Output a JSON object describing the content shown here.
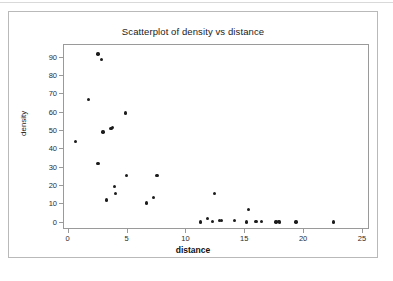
{
  "figure": {
    "title": "Scatterplot of density vs distance",
    "xlabel": "distance",
    "ylabel": "density"
  },
  "chart_data": {
    "type": "scatter",
    "title": "Scatterplot of density vs distance",
    "xlabel": "distance",
    "ylabel": "density",
    "xlim": [
      -0.4,
      25.6
    ],
    "ylim": [
      -4,
      97
    ],
    "xticks": [
      0,
      5,
      10,
      15,
      20,
      25
    ],
    "yticks": [
      0,
      10,
      20,
      30,
      40,
      50,
      60,
      70,
      80,
      90
    ],
    "grid": false,
    "legend": null,
    "marker": "filled-circle",
    "marker_color": "#1c1c1c",
    "series": [
      {
        "name": "density vs distance",
        "points": [
          [
            0.6,
            44.4
          ],
          [
            1.7,
            67.4
          ],
          [
            2.5,
            92.1
          ],
          [
            2.8,
            89.0
          ],
          [
            2.5,
            32.3
          ],
          [
            2.9,
            49.5
          ],
          [
            3.2,
            12.4
          ],
          [
            3.6,
            51.5
          ],
          [
            3.7,
            52.0
          ],
          [
            3.9,
            19.6
          ],
          [
            4.0,
            15.8
          ],
          [
            4.8,
            59.8
          ],
          [
            4.9,
            25.6
          ],
          [
            6.6,
            10.7
          ],
          [
            7.2,
            13.9
          ],
          [
            7.5,
            25.6
          ],
          [
            11.2,
            0.3
          ],
          [
            11.8,
            2.4
          ],
          [
            12.2,
            0.6
          ],
          [
            12.4,
            15.8
          ],
          [
            12.8,
            1.2
          ],
          [
            13.0,
            1.1
          ],
          [
            14.1,
            1.2
          ],
          [
            15.1,
            0.4
          ],
          [
            15.3,
            7.2
          ],
          [
            15.9,
            0.5
          ],
          [
            16.4,
            0.8
          ],
          [
            17.6,
            0.4
          ],
          [
            17.8,
            0.5
          ],
          [
            17.9,
            0.3
          ],
          [
            19.3,
            0.4
          ],
          [
            22.5,
            0.3
          ]
        ]
      }
    ]
  }
}
